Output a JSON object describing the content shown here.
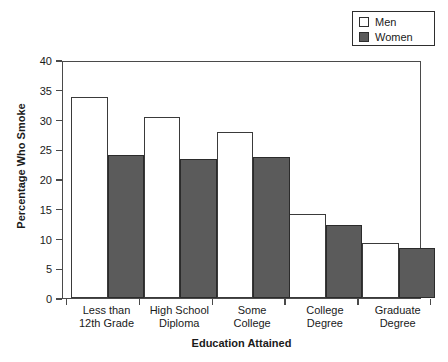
{
  "chart_data": {
    "type": "bar",
    "title": "",
    "xlabel": "Education Attained",
    "ylabel": "Percentage Who Smoke",
    "categories": [
      "Less than 12th Grade",
      "High School Diploma",
      "Some College",
      "College Degree",
      "Graduate Degree"
    ],
    "category_lines": [
      [
        "Less than",
        "12th Grade"
      ],
      [
        "High School",
        "Diploma"
      ],
      [
        "Some",
        "College"
      ],
      [
        "College",
        "Degree"
      ],
      [
        "Graduate",
        "Degree"
      ]
    ],
    "series": [
      {
        "name": "Men",
        "values": [
          33.8,
          30.4,
          27.9,
          14.2,
          9.3
        ],
        "color": "#ffffff"
      },
      {
        "name": "Women",
        "values": [
          24.1,
          23.4,
          23.7,
          12.3,
          8.4
        ],
        "color": "#5b5b5b"
      }
    ],
    "ylim": [
      0,
      40
    ],
    "yticks": [
      0,
      5,
      10,
      15,
      20,
      25,
      30,
      35,
      40
    ],
    "ytick_labels": [
      "0",
      "5",
      "10",
      "15",
      "20",
      "25",
      "30",
      "35",
      "40"
    ],
    "grid": false,
    "legend_position": "top-right",
    "legend_entries": [
      {
        "label": "Men",
        "swatch": "open-square-swatch"
      },
      {
        "label": "Women",
        "swatch": "filled-square-swatch"
      }
    ]
  }
}
